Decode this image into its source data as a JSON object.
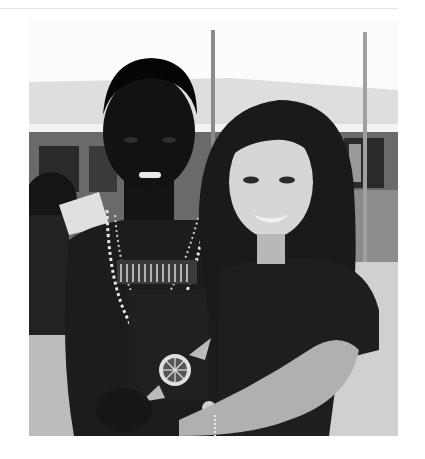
{
  "page": {
    "background": "#ffffff",
    "divider_color": "#e6e6e6"
  },
  "photo": {
    "description": "Black-and-white photograph of two smiling young women embracing outdoors in front of a single-story building with a corrugated roof and wooden poles",
    "style": "grayscale",
    "subjects": [
      {
        "position": "left",
        "description": "young woman with short dark hair wearing layered beaded necklaces and a dark top"
      },
      {
        "position": "right",
        "description": "young woman with long dark hair wearing a dark t-shirt, arm wrapped around the other"
      }
    ],
    "background": "building with corrugated roof, windows, wooden poles, dirt ground, people on left",
    "palette": {
      "sky": "#fbfbfb",
      "roof": "#dcdcdc",
      "wall": "#6e6e6e",
      "ground": "#bdbdbd",
      "dark": "#111111",
      "skin_light": "#d8d8d8",
      "skin_dark": "#1a1a1a",
      "beads": "#e8e8e8"
    }
  }
}
